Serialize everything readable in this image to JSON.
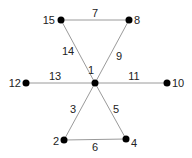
{
  "diagram": {
    "type": "graph",
    "colors": {
      "edge": "#9a9a9a",
      "node": "#000000",
      "text": "#222222",
      "background": "#ffffff"
    },
    "nodes": [
      {
        "id": "1",
        "label": "1",
        "x": 95,
        "y": 83,
        "lx": 91,
        "ly": 74,
        "anchor": "middle"
      },
      {
        "id": "15",
        "label": "15",
        "x": 61,
        "y": 20,
        "lx": 55,
        "ly": 24,
        "anchor": "end"
      },
      {
        "id": "8",
        "label": "8",
        "x": 129,
        "y": 20,
        "lx": 134,
        "ly": 24,
        "anchor": "start"
      },
      {
        "id": "12",
        "label": "12",
        "x": 26,
        "y": 83,
        "lx": 21,
        "ly": 87,
        "anchor": "end"
      },
      {
        "id": "10",
        "label": "10",
        "x": 167,
        "y": 83,
        "lx": 172,
        "ly": 87,
        "anchor": "start"
      },
      {
        "id": "2",
        "label": "2",
        "x": 64,
        "y": 140,
        "lx": 59,
        "ly": 145,
        "anchor": "end"
      },
      {
        "id": "4",
        "label": "4",
        "x": 126,
        "y": 139,
        "lx": 131,
        "ly": 147,
        "anchor": "start"
      }
    ],
    "edges": [
      {
        "id": "7",
        "from": "15",
        "to": "8",
        "label": "7",
        "lx": 95,
        "ly": 17
      },
      {
        "id": "14",
        "from": "15",
        "to": "1",
        "label": "14",
        "lx": 68,
        "ly": 55
      },
      {
        "id": "9",
        "from": "8",
        "to": "1",
        "label": "9",
        "lx": 119,
        "ly": 60
      },
      {
        "id": "13",
        "from": "12",
        "to": "1",
        "label": "13",
        "lx": 55,
        "ly": 80
      },
      {
        "id": "11",
        "from": "1",
        "to": "10",
        "label": "11",
        "lx": 134,
        "ly": 80
      },
      {
        "id": "3",
        "from": "1",
        "to": "2",
        "label": "3",
        "lx": 73,
        "ly": 113
      },
      {
        "id": "5",
        "from": "1",
        "to": "4",
        "label": "5",
        "lx": 116,
        "ly": 113
      },
      {
        "id": "6",
        "from": "2",
        "to": "4",
        "label": "6",
        "lx": 95,
        "ly": 151
      }
    ]
  }
}
